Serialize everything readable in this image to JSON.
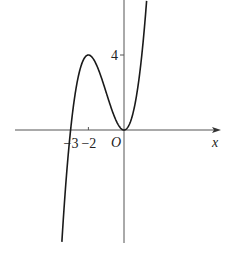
{
  "chart_data": {
    "type": "line",
    "title": "",
    "xlabel": "x",
    "ylabel": "",
    "origin_label": "O",
    "function": "y = x^3 + 3x^2",
    "coefficients_desc": [
      1,
      3,
      0,
      0
    ],
    "domain_drawn": [
      -3.49,
      1.27
    ],
    "xlim": [
      -6.1,
      5.4
    ],
    "ylim": [
      -6.2,
      6.9
    ],
    "grid": false,
    "legend": "none",
    "x_ticks": [
      {
        "value": -3,
        "label": "−3"
      },
      {
        "value": -2,
        "label": "−2"
      }
    ],
    "y_ticks": [
      {
        "value": 4,
        "label": "4"
      }
    ],
    "series": [
      {
        "name": "f(x)",
        "x": [
          -3.5,
          -3.25,
          -3.0,
          -2.75,
          -2.5,
          -2.25,
          -2.0,
          -1.75,
          -1.5,
          -1.25,
          -1.0,
          -0.75,
          -0.5,
          -0.25,
          0.0,
          0.25,
          0.5,
          0.75,
          1.0,
          1.25
        ],
        "y": [
          -6.125,
          -2.641,
          0,
          1.891,
          3.125,
          3.797,
          4,
          3.828,
          3.375,
          2.734,
          2,
          1.266,
          0.625,
          0.172,
          0,
          0.203,
          0.875,
          2.109,
          4,
          6.641
        ]
      }
    ],
    "key_points": [
      {
        "name": "local-max",
        "x": -2,
        "y": 4
      },
      {
        "name": "local-min",
        "x": 0,
        "y": 0
      },
      {
        "name": "root",
        "x": -3,
        "y": 0
      }
    ]
  }
}
